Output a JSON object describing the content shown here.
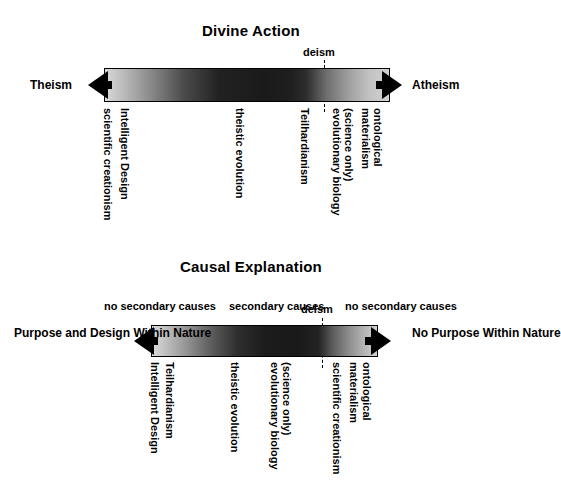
{
  "figure": {
    "background_color": "#ffffff",
    "ink_color": "#000000"
  },
  "diagrams": [
    {
      "id": "divine-action",
      "title": "Divine Action",
      "left_end_label": "Theism",
      "right_end_label": "Atheism",
      "marker_label": "deism",
      "positions": [
        "scientific creationism",
        "Intelligent Design",
        "theistic evolution",
        "Teilhardianism",
        "evolutionary biology",
        "(science only)",
        "evolutionary materialism",
        "ontological"
      ]
    },
    {
      "id": "causal-explanation",
      "title": "Causal Explanation",
      "left_end_label_line1": "Purpose and Design",
      "left_end_label_line2": "Within Nature",
      "right_end_label_line1": "No Purpose",
      "right_end_label_line2": "Within Nature",
      "marker_label": "deism",
      "captions": [
        {
          "line1": "no secondary",
          "line2": "causes"
        },
        {
          "line1": "secondary",
          "line2": "causes"
        },
        {
          "line1": "no secondary",
          "line2": "causes"
        }
      ]
    }
  ],
  "labels": {
    "divine": {
      "title": "Divine Action",
      "theism": "Theism",
      "atheism": "Atheism",
      "deism": "deism",
      "scientific_creationism": "scientific creationism",
      "intelligent_design": "Intelligent Design",
      "theistic_evolution": "theistic evolution",
      "teilhardianism": "Teilhardianism",
      "evolutionary_biology": "evolutionary biology",
      "science_only": "(science only)",
      "materialism": "materialism",
      "ontological": "ontological"
    },
    "causal": {
      "title": "Causal Explanation",
      "purpose_line1": "Purpose and Design",
      "purpose_line2": "Within Nature",
      "nopurpose_line1": "No Purpose",
      "nopurpose_line2": "Within Nature",
      "deism": "deism",
      "cause_left_line1": "no secondary",
      "cause_left_line2": "causes",
      "cause_mid_line1": "secondary",
      "cause_mid_line2": "causes",
      "cause_right_line1": "no secondary",
      "cause_right_line2": "causes",
      "intelligent_design": "Intelligent Design",
      "teilhardianism": "Teilhardianism",
      "theistic_evolution": "theistic evolution",
      "evolutionary_biology": "evolutionary biology",
      "science_only": "(science only)",
      "scientific_creationism": "scientific creationism",
      "materialism": "materialism",
      "ontological": "ontological"
    }
  }
}
